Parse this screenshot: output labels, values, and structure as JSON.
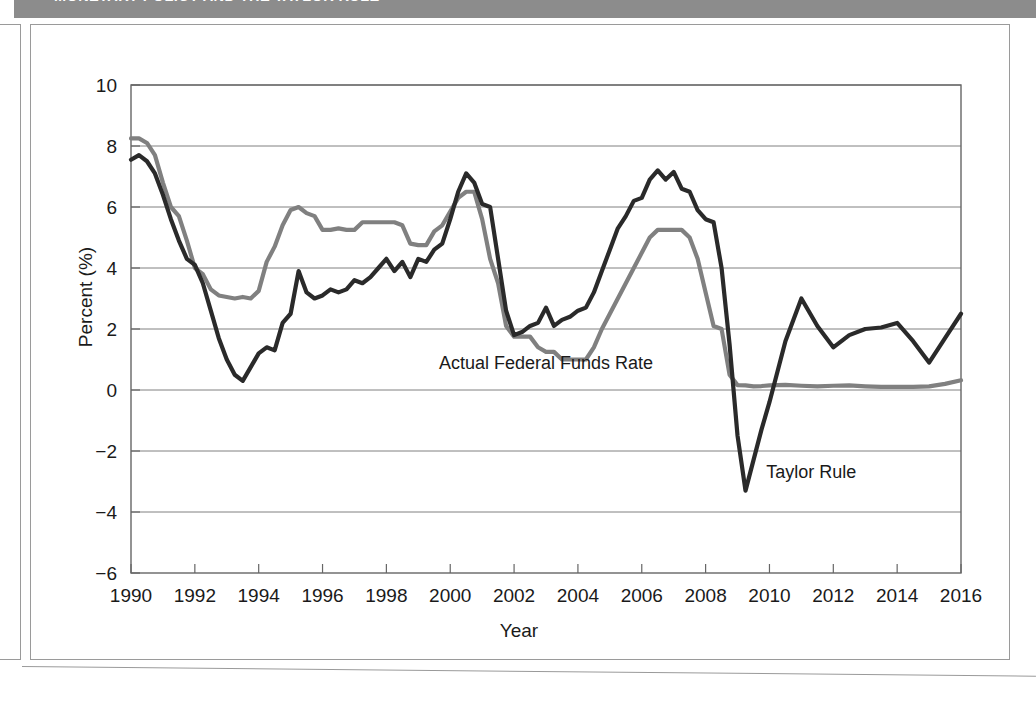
{
  "banner": {
    "title": "MONETARY POLICY AND THE TAYLOR RULE"
  },
  "figure": {
    "ylabel": "Percent (%)",
    "xlabel": "Year"
  },
  "annotations": {
    "actual": "Actual Federal Funds Rate",
    "taylor": "Taylor Rule"
  },
  "colors": {
    "banner_bg": "#8c8c8c",
    "frame": "#9a9a9a",
    "grid": "#808080",
    "actual_line": "#808080",
    "taylor_line": "#2a2a2a",
    "text": "#1a1a1a"
  },
  "chart_data": {
    "type": "line",
    "title": "Monetary Policy and the Taylor Rule",
    "xlabel": "Year",
    "ylabel": "Percent (%)",
    "xlim": [
      1990,
      2016
    ],
    "ylim": [
      -6,
      10
    ],
    "xticks": [
      1990,
      1992,
      1994,
      1996,
      1998,
      2000,
      2002,
      2004,
      2006,
      2008,
      2010,
      2012,
      2014,
      2016
    ],
    "yticks": [
      -6,
      -4,
      -2,
      0,
      2,
      4,
      6,
      8,
      10
    ],
    "grid": "horizontal",
    "legend_position": "inline-annotations",
    "series": [
      {
        "name": "Actual Federal Funds Rate",
        "color": "#808080",
        "x": [
          1990.0,
          1990.25,
          1990.5,
          1990.75,
          1991.0,
          1991.25,
          1991.5,
          1991.75,
          1992.0,
          1992.25,
          1992.5,
          1992.75,
          1993.0,
          1993.25,
          1993.5,
          1993.75,
          1994.0,
          1994.25,
          1994.5,
          1994.75,
          1995.0,
          1995.25,
          1995.5,
          1995.75,
          1996.0,
          1996.25,
          1996.5,
          1996.75,
          1997.0,
          1997.25,
          1997.5,
          1997.75,
          1998.0,
          1998.25,
          1998.5,
          1998.75,
          1999.0,
          1999.25,
          1999.5,
          1999.75,
          2000.0,
          2000.25,
          2000.5,
          2000.75,
          2001.0,
          2001.25,
          2001.5,
          2001.75,
          2002.0,
          2002.25,
          2002.5,
          2002.75,
          2003.0,
          2003.25,
          2003.5,
          2003.75,
          2004.0,
          2004.25,
          2004.5,
          2004.75,
          2005.0,
          2005.25,
          2005.5,
          2005.75,
          2006.0,
          2006.25,
          2006.5,
          2006.75,
          2007.0,
          2007.25,
          2007.5,
          2007.75,
          2008.0,
          2008.25,
          2008.5,
          2008.75,
          2009.0,
          2009.25,
          2009.5,
          2009.75,
          2010.0,
          2010.5,
          2011.0,
          2011.5,
          2012.0,
          2012.5,
          2013.0,
          2013.5,
          2014.0,
          2014.5,
          2015.0,
          2015.5,
          2016.0
        ],
        "values": [
          8.25,
          8.25,
          8.1,
          7.7,
          6.8,
          6.0,
          5.7,
          4.9,
          4.0,
          3.8,
          3.3,
          3.1,
          3.05,
          3.0,
          3.05,
          3.0,
          3.25,
          4.2,
          4.7,
          5.4,
          5.9,
          6.0,
          5.8,
          5.7,
          5.25,
          5.25,
          5.3,
          5.25,
          5.25,
          5.5,
          5.5,
          5.5,
          5.5,
          5.5,
          5.4,
          4.8,
          4.75,
          4.75,
          5.2,
          5.4,
          5.85,
          6.3,
          6.5,
          6.5,
          5.6,
          4.3,
          3.5,
          2.1,
          1.75,
          1.75,
          1.75,
          1.4,
          1.25,
          1.25,
          1.0,
          1.0,
          1.0,
          1.0,
          1.4,
          2.0,
          2.5,
          3.0,
          3.5,
          4.0,
          4.5,
          5.0,
          5.25,
          5.25,
          5.25,
          5.25,
          5.0,
          4.3,
          3.2,
          2.1,
          2.0,
          0.5,
          0.16,
          0.15,
          0.12,
          0.13,
          0.15,
          0.17,
          0.14,
          0.12,
          0.14,
          0.15,
          0.12,
          0.1,
          0.1,
          0.1,
          0.12,
          0.2,
          0.32
        ]
      },
      {
        "name": "Taylor Rule",
        "color": "#2a2a2a",
        "x": [
          1990.0,
          1990.25,
          1990.5,
          1990.75,
          1991.0,
          1991.25,
          1991.5,
          1991.75,
          1992.0,
          1992.25,
          1992.5,
          1992.75,
          1993.0,
          1993.25,
          1993.5,
          1993.75,
          1994.0,
          1994.25,
          1994.5,
          1994.75,
          1995.0,
          1995.25,
          1995.5,
          1995.75,
          1996.0,
          1996.25,
          1996.5,
          1996.75,
          1997.0,
          1997.25,
          1997.5,
          1997.75,
          1998.0,
          1998.25,
          1998.5,
          1998.75,
          1999.0,
          1999.25,
          1999.5,
          1999.75,
          2000.0,
          2000.25,
          2000.5,
          2000.75,
          2001.0,
          2001.25,
          2001.5,
          2001.75,
          2002.0,
          2002.25,
          2002.5,
          2002.75,
          2003.0,
          2003.25,
          2003.5,
          2003.75,
          2004.0,
          2004.25,
          2004.5,
          2004.75,
          2005.0,
          2005.25,
          2005.5,
          2005.75,
          2006.0,
          2006.25,
          2006.5,
          2006.75,
          2007.0,
          2007.25,
          2007.5,
          2007.75,
          2008.0,
          2008.25,
          2008.5,
          2008.75,
          2009.0,
          2009.25,
          2009.5,
          2009.75,
          2010.0,
          2010.5,
          2011.0,
          2011.5,
          2012.0,
          2012.5,
          2013.0,
          2013.5,
          2014.0,
          2014.5,
          2015.0,
          2015.5,
          2016.0
        ],
        "values": [
          7.55,
          7.7,
          7.5,
          7.1,
          6.4,
          5.6,
          4.9,
          4.3,
          4.1,
          3.5,
          2.6,
          1.7,
          1.0,
          0.5,
          0.3,
          0.75,
          1.2,
          1.4,
          1.3,
          2.2,
          2.5,
          3.9,
          3.2,
          3.0,
          3.1,
          3.3,
          3.2,
          3.3,
          3.6,
          3.5,
          3.7,
          4.0,
          4.3,
          3.9,
          4.2,
          3.7,
          4.3,
          4.2,
          4.6,
          4.8,
          5.6,
          6.5,
          7.1,
          6.8,
          6.1,
          6.0,
          4.3,
          2.6,
          1.8,
          1.9,
          2.1,
          2.2,
          2.7,
          2.1,
          2.3,
          2.4,
          2.6,
          2.7,
          3.2,
          3.9,
          4.6,
          5.3,
          5.7,
          6.2,
          6.3,
          6.9,
          7.2,
          6.9,
          7.15,
          6.6,
          6.5,
          5.9,
          5.6,
          5.5,
          4.0,
          1.5,
          -1.5,
          -3.3,
          -2.3,
          -1.3,
          -0.4,
          1.6,
          3.0,
          2.1,
          1.4,
          1.8,
          2.0,
          2.05,
          2.2,
          1.6,
          0.9,
          1.7,
          2.5
        ]
      }
    ],
    "annotations": [
      {
        "text": "Actual Federal Funds Rate",
        "x": 2003.0,
        "y": 0.7
      },
      {
        "text": "Taylor Rule",
        "x": 2009.9,
        "y": -2.9
      }
    ]
  }
}
